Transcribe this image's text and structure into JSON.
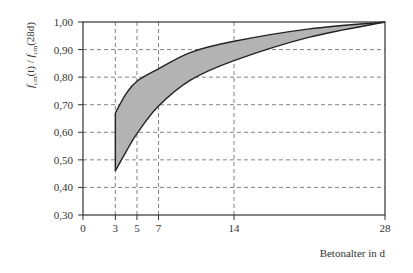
{
  "chart_data": {
    "type": "area",
    "title": "",
    "xlabel": "Betonalter in d",
    "ylabel": "f_cm(t) / f_cm(28d)",
    "ylabel_parts": {
      "f1": "f",
      "sub1": "cm",
      "mid": "(t) / ",
      "f2": "f",
      "sub2": "cm",
      "end": "(28d)"
    },
    "xlim": [
      0,
      28
    ],
    "ylim": [
      0.3,
      1.0
    ],
    "x_ticks": [
      0,
      3,
      5,
      7,
      14,
      28
    ],
    "x_tick_labels": [
      "0",
      "3",
      "5",
      "7",
      "14",
      "28"
    ],
    "y_ticks": [
      0.3,
      0.4,
      0.5,
      0.6,
      0.7,
      0.8,
      0.9,
      1.0
    ],
    "y_tick_labels": [
      "0,30",
      "0,40",
      "0,50",
      "0,60",
      "0,70",
      "0,80",
      "0,90",
      "1,00"
    ],
    "grid": {
      "x": [
        3,
        5,
        7,
        14
      ],
      "y": [
        0.4,
        0.5,
        0.6,
        0.7,
        0.8,
        0.9
      ],
      "style": "dashed"
    },
    "legend": null,
    "series": [
      {
        "name": "upper bound",
        "x": [
          3,
          4,
          5,
          7,
          10,
          14,
          21,
          28
        ],
        "values": [
          0.67,
          0.74,
          0.785,
          0.83,
          0.89,
          0.93,
          0.975,
          1.0
        ]
      },
      {
        "name": "lower bound",
        "x": [
          3,
          4,
          5,
          7,
          10,
          14,
          21,
          28
        ],
        "values": [
          0.46,
          0.53,
          0.595,
          0.695,
          0.79,
          0.86,
          0.945,
          1.0
        ]
      }
    ],
    "fill_between": {
      "series": [
        "upper bound",
        "lower bound"
      ],
      "color": "#b3b3b3"
    }
  },
  "colors": {
    "axis": "#333333",
    "grid": "#666666",
    "curve": "#222222",
    "band_fill": "#b3b3b3",
    "text": "#333333"
  }
}
